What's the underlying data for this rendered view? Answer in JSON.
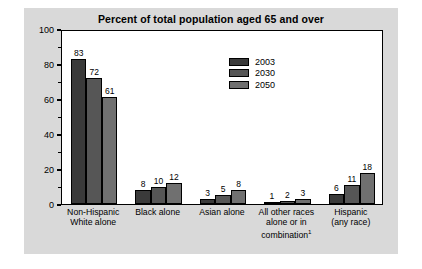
{
  "chart_data": {
    "type": "bar",
    "title": "Percent of total population aged 65 and over",
    "xlabel": "",
    "ylabel": "",
    "ylim": [
      0,
      100
    ],
    "ytick_values": [
      0,
      20,
      40,
      60,
      80,
      100
    ],
    "ytick_labels": [
      "0",
      "20",
      "40",
      "60",
      "80",
      "100"
    ],
    "minor_tick_interval": 10,
    "grid": false,
    "legend_position": "inside-upper-center",
    "categories": [
      "Non-Hispanic White alone",
      "Black alone",
      "Asian alone",
      "All other races alone or in combination",
      "Hispanic (any race)"
    ],
    "category_lines": [
      [
        "Non-Hispanic",
        "White alone"
      ],
      [
        "Black alone"
      ],
      [
        "Asian alone"
      ],
      [
        "All other races",
        "alone or in",
        "combination"
      ],
      [
        "Hispanic",
        "(any race)"
      ]
    ],
    "category_footnote_marker": "1",
    "category_footnote_index": 3,
    "series": [
      {
        "name": "2003",
        "color": "#3a3a3a",
        "values": [
          83,
          8,
          3,
          1,
          6
        ]
      },
      {
        "name": "2030",
        "color": "#565656",
        "values": [
          72,
          10,
          5,
          2,
          11
        ]
      },
      {
        "name": "2050",
        "color": "#707070",
        "values": [
          61,
          12,
          8,
          3,
          18
        ]
      }
    ]
  },
  "figure": {
    "background_color": "#d9d9d9",
    "plot_background_color": "#ffffff",
    "axis_color": "#000000"
  }
}
